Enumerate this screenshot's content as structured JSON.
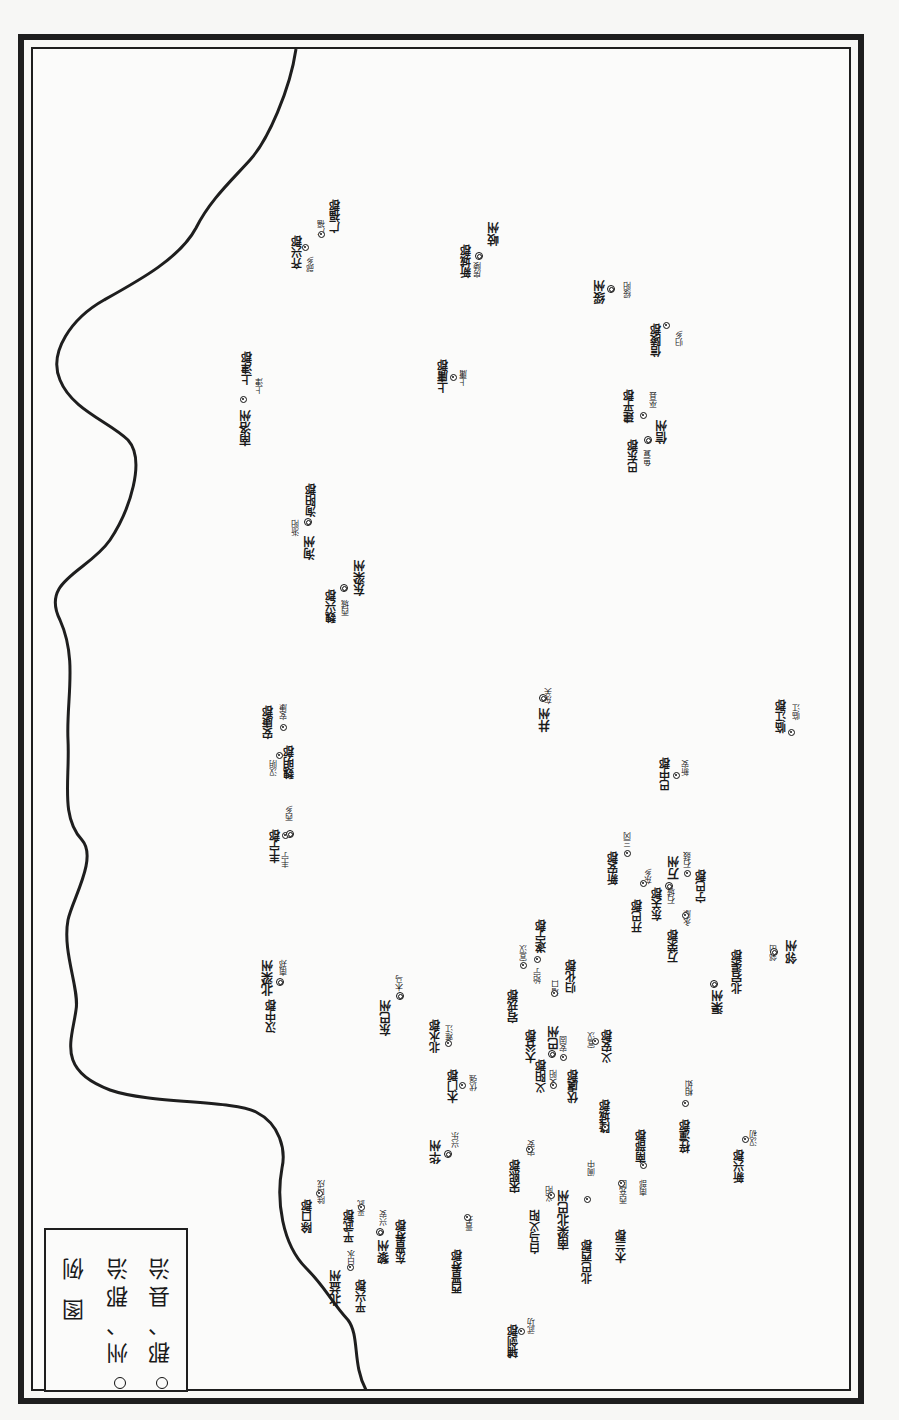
{
  "map": {
    "orientation": "rotated-90-ccw",
    "colors": {
      "ink": "#1e1e1e",
      "paper": "#fbfbfa"
    }
  },
  "legend": {
    "title": "图 例",
    "items": [
      {
        "symbol": "double-circle",
        "label": "州、郡治"
      },
      {
        "symbol": "dot-circle",
        "label": "郡、县治"
      }
    ]
  },
  "places": [
    {
      "id": "p1",
      "name": "齐兴郡",
      "kind": "jun",
      "x": 292,
      "y": 236
    },
    {
      "id": "p2",
      "name": "郧乡",
      "kind": "xian",
      "x": 307,
      "y": 256
    },
    {
      "id": "p3",
      "name": "广福",
      "kind": "xian",
      "x": 318,
      "y": 220
    },
    {
      "id": "p4",
      "name": "广福郡",
      "kind": "jun",
      "x": 330,
      "y": 200
    },
    {
      "id": "p5",
      "name": "新城郡",
      "kind": "jun",
      "x": 461,
      "y": 245
    },
    {
      "id": "p6",
      "name": "房陵",
      "kind": "xian",
      "x": 474,
      "y": 262
    },
    {
      "id": "p7",
      "name": "岐州",
      "kind": "zhou",
      "x": 488,
      "y": 222
    },
    {
      "id": "p8",
      "name": "绥州",
      "kind": "zhou",
      "x": 594,
      "y": 280
    },
    {
      "id": "p9",
      "name": "绥阳",
      "kind": "xian",
      "x": 624,
      "y": 282
    },
    {
      "id": "p10",
      "name": "信陵郡",
      "kind": "jun",
      "x": 651,
      "y": 324
    },
    {
      "id": "p11",
      "name": "归乡",
      "kind": "xian",
      "x": 676,
      "y": 330
    },
    {
      "id": "p12",
      "name": "南洛州",
      "kind": "zhou",
      "x": 240,
      "y": 410
    },
    {
      "id": "p13",
      "name": "上津郡",
      "kind": "jun",
      "x": 242,
      "y": 352
    },
    {
      "id": "p14",
      "name": "上津",
      "kind": "xian",
      "x": 256,
      "y": 378
    },
    {
      "id": "p15",
      "name": "上庸郡",
      "kind": "jun",
      "x": 438,
      "y": 360
    },
    {
      "id": "p16",
      "name": "上庸",
      "kind": "xian",
      "x": 460,
      "y": 370
    },
    {
      "id": "p17",
      "name": "建平郡",
      "kind": "jun",
      "x": 624,
      "y": 390
    },
    {
      "id": "p18",
      "name": "巫县",
      "kind": "xian",
      "x": 650,
      "y": 392
    },
    {
      "id": "p19",
      "name": "巴东郡",
      "kind": "jun",
      "x": 628,
      "y": 440
    },
    {
      "id": "p20",
      "name": "鱼复",
      "kind": "xian",
      "x": 644,
      "y": 450
    },
    {
      "id": "p21",
      "name": "信州",
      "kind": "zhou",
      "x": 656,
      "y": 420
    },
    {
      "id": "p22",
      "name": "淅阳",
      "kind": "xian",
      "x": 292,
      "y": 520
    },
    {
      "id": "p23",
      "name": "洵州",
      "kind": "zhou",
      "x": 304,
      "y": 536
    },
    {
      "id": "p24",
      "name": "洵阳郡",
      "kind": "jun",
      "x": 306,
      "y": 484
    },
    {
      "id": "p25",
      "name": "魏兴郡",
      "kind": "jun",
      "x": 326,
      "y": 590
    },
    {
      "id": "p26",
      "name": "西城",
      "kind": "xian",
      "x": 342,
      "y": 600
    },
    {
      "id": "p27",
      "name": "东梁州",
      "kind": "zhou",
      "x": 354,
      "y": 560
    },
    {
      "id": "p28",
      "name": "安康郡",
      "kind": "jun",
      "x": 263,
      "y": 706
    },
    {
      "id": "p29",
      "name": "安康",
      "kind": "xian",
      "x": 280,
      "y": 704
    },
    {
      "id": "p30",
      "name": "汉阴",
      "kind": "xian",
      "x": 270,
      "y": 760
    },
    {
      "id": "p31",
      "name": "魏明郡",
      "kind": "jun",
      "x": 284,
      "y": 746
    },
    {
      "id": "p32",
      "name": "井州",
      "kind": "zhou",
      "x": 539,
      "y": 708
    },
    {
      "id": "p33",
      "name": "东关",
      "kind": "xian",
      "x": 545,
      "y": 688
    },
    {
      "id": "p34",
      "name": "临江郡",
      "kind": "jun",
      "x": 776,
      "y": 700
    },
    {
      "id": "p35",
      "name": "临江",
      "kind": "xian",
      "x": 793,
      "y": 704
    },
    {
      "id": "p36",
      "name": "巴中郡",
      "kind": "jun",
      "x": 660,
      "y": 758
    },
    {
      "id": "p37",
      "name": "新安",
      "kind": "xian",
      "x": 682,
      "y": 760
    },
    {
      "id": "p38",
      "name": "丰宁郡",
      "kind": "jun",
      "x": 270,
      "y": 830
    },
    {
      "id": "p39",
      "name": "丰宁",
      "kind": "xian",
      "x": 282,
      "y": 852
    },
    {
      "id": "p40",
      "name": "西乡",
      "kind": "xian",
      "x": 286,
      "y": 805
    },
    {
      "id": "p41",
      "name": "新安郡",
      "kind": "jun",
      "x": 608,
      "y": 852
    },
    {
      "id": "p42",
      "name": "三冈",
      "kind": "xian",
      "x": 624,
      "y": 832
    },
    {
      "id": "p43",
      "name": "开巴郡",
      "kind": "jun",
      "x": 632,
      "y": 900
    },
    {
      "id": "p44",
      "name": "东乡",
      "kind": "xian",
      "x": 645,
      "y": 868
    },
    {
      "id": "p45",
      "name": "万州",
      "kind": "zhou",
      "x": 668,
      "y": 856
    },
    {
      "id": "p46",
      "name": "东关郡",
      "kind": "jun",
      "x": 652,
      "y": 888
    },
    {
      "id": "p47",
      "name": "石城",
      "kind": "xian",
      "x": 668,
      "y": 888
    },
    {
      "id": "p48",
      "name": "石鼓",
      "kind": "xian",
      "x": 684,
      "y": 852
    },
    {
      "id": "p49",
      "name": "宁巴郡",
      "kind": "jun",
      "x": 696,
      "y": 870
    },
    {
      "id": "p50",
      "name": "万荣郡",
      "kind": "jun",
      "x": 668,
      "y": 930
    },
    {
      "id": "p51",
      "name": "永康",
      "kind": "xian",
      "x": 684,
      "y": 910
    },
    {
      "id": "p52",
      "name": "北梁州",
      "kind": "zhou",
      "x": 262,
      "y": 960
    },
    {
      "id": "p53",
      "name": "汉中郡",
      "kind": "jun",
      "x": 266,
      "y": 1000
    },
    {
      "id": "p54",
      "name": "南郑",
      "kind": "xian",
      "x": 280,
      "y": 960
    },
    {
      "id": "p55",
      "name": "东巴州",
      "kind": "zhou",
      "x": 380,
      "y": 1000
    },
    {
      "id": "p56",
      "name": "木马",
      "kind": "xian",
      "x": 396,
      "y": 975
    },
    {
      "id": "p57",
      "name": "宣汉",
      "kind": "xian",
      "x": 520,
      "y": 945
    },
    {
      "id": "p58",
      "name": "宕戎郡",
      "kind": "jun",
      "x": 508,
      "y": 990
    },
    {
      "id": "p59",
      "name": "始宁",
      "kind": "xian",
      "x": 534,
      "y": 968
    },
    {
      "id": "p60",
      "name": "遂宁郡",
      "kind": "jun",
      "x": 536,
      "y": 920
    },
    {
      "id": "p61",
      "name": "增口",
      "kind": "xian",
      "x": 552,
      "y": 980
    },
    {
      "id": "p62",
      "name": "归化郡",
      "kind": "jun",
      "x": 566,
      "y": 960
    },
    {
      "id": "p63",
      "name": "渠州",
      "kind": "zhou",
      "x": 712,
      "y": 990
    },
    {
      "id": "p64",
      "name": "北宕渠郡",
      "kind": "jun",
      "x": 732,
      "y": 950
    },
    {
      "id": "p65",
      "name": "邻州",
      "kind": "zhou",
      "x": 786,
      "y": 940
    },
    {
      "id": "p66",
      "name": "邻山",
      "kind": "xian",
      "x": 770,
      "y": 945
    },
    {
      "id": "p67",
      "name": "北水郡",
      "kind": "jun",
      "x": 430,
      "y": 1020
    },
    {
      "id": "p68",
      "name": "难江",
      "kind": "xian",
      "x": 446,
      "y": 1025
    },
    {
      "id": "p69",
      "name": "大谷郡",
      "kind": "jun",
      "x": 526,
      "y": 1030
    },
    {
      "id": "p70",
      "name": "巴州",
      "kind": "zhou",
      "x": 548,
      "y": 1026
    },
    {
      "id": "p71",
      "name": "安固",
      "kind": "xian",
      "x": 560,
      "y": 1036
    },
    {
      "id": "p72",
      "name": "宣汉",
      "kind": "xian",
      "x": 588,
      "y": 1032
    },
    {
      "id": "p73",
      "name": "义安郡",
      "kind": "jun",
      "x": 602,
      "y": 1030
    },
    {
      "id": "p74",
      "name": "木门郡",
      "kind": "jun",
      "x": 448,
      "y": 1070
    },
    {
      "id": "p75",
      "name": "伏强",
      "kind": "xian",
      "x": 470,
      "y": 1075
    },
    {
      "id": "p76",
      "name": "义阳郡",
      "kind": "jun",
      "x": 536,
      "y": 1060
    },
    {
      "id": "p77",
      "name": "义阳",
      "kind": "xian",
      "x": 550,
      "y": 1070
    },
    {
      "id": "p78",
      "name": "伏虞郡",
      "kind": "jun",
      "x": 568,
      "y": 1070
    },
    {
      "id": "p79",
      "name": "隆城郡",
      "kind": "jun",
      "x": 600,
      "y": 1100
    },
    {
      "id": "p80",
      "name": "华州",
      "kind": "zhou",
      "x": 430,
      "y": 1140
    },
    {
      "id": "p81",
      "name": "兴乐",
      "kind": "xian",
      "x": 452,
      "y": 1132
    },
    {
      "id": "p82",
      "name": "宋熙郡",
      "kind": "jun",
      "x": 510,
      "y": 1160
    },
    {
      "id": "p83",
      "name": "宋安",
      "kind": "xian",
      "x": 528,
      "y": 1140
    },
    {
      "id": "p84",
      "name": "白马义阳",
      "kind": "jun",
      "x": 530,
      "y": 1210
    },
    {
      "id": "p85",
      "name": "义阳",
      "kind": "xian",
      "x": 546,
      "y": 1186
    },
    {
      "id": "p86",
      "name": "南梁北巴州",
      "kind": "zhou",
      "x": 558,
      "y": 1190
    },
    {
      "id": "p87",
      "name": "北巴西郡",
      "kind": "jun",
      "x": 582,
      "y": 1240
    },
    {
      "id": "p88",
      "name": "阆中",
      "kind": "xian",
      "x": 588,
      "y": 1160
    },
    {
      "id": "p89",
      "name": "木兰郡",
      "kind": "jun",
      "x": 616,
      "y": 1230
    },
    {
      "id": "p90",
      "name": "西充国",
      "kind": "xian",
      "x": 620,
      "y": 1180
    },
    {
      "id": "p91",
      "name": "南部郡",
      "kind": "jun",
      "x": 636,
      "y": 1130
    },
    {
      "id": "p92",
      "name": "南部",
      "kind": "xian",
      "x": 640,
      "y": 1180
    },
    {
      "id": "p93",
      "name": "梓潼郡",
      "kind": "jun",
      "x": 680,
      "y": 1120
    },
    {
      "id": "p94",
      "name": "相如",
      "kind": "xian",
      "x": 686,
      "y": 1080
    },
    {
      "id": "p95",
      "name": "新兴郡",
      "kind": "jun",
      "x": 734,
      "y": 1150
    },
    {
      "id": "p96",
      "name": "汉初",
      "kind": "xian",
      "x": 750,
      "y": 1130
    },
    {
      "id": "p97",
      "name": "除口郡",
      "kind": "jun",
      "x": 302,
      "y": 1200
    },
    {
      "id": "p98",
      "name": "除口戍",
      "kind": "xian",
      "x": 318,
      "y": 1180
    },
    {
      "id": "p99",
      "name": "平武郡",
      "kind": "jun",
      "x": 344,
      "y": 1210
    },
    {
      "id": "p100",
      "name": "平武",
      "kind": "xian",
      "x": 358,
      "y": 1200
    },
    {
      "id": "p101",
      "name": "北益州",
      "kind": "zhou",
      "x": 330,
      "y": 1270
    },
    {
      "id": "p102",
      "name": "白水",
      "kind": "xian",
      "x": 348,
      "y": 1250
    },
    {
      "id": "p103",
      "name": "平兴郡",
      "kind": "jun",
      "x": 356,
      "y": 1280
    },
    {
      "id": "p104",
      "name": "黎州",
      "kind": "zhou",
      "x": 378,
      "y": 1240
    },
    {
      "id": "p105",
      "name": "兴安",
      "kind": "xian",
      "x": 380,
      "y": 1210
    },
    {
      "id": "p106",
      "name": "东晋寿郡",
      "kind": "jun",
      "x": 396,
      "y": 1220
    },
    {
      "id": "p107",
      "name": "西晋寿郡",
      "kind": "jun",
      "x": 452,
      "y": 1250
    },
    {
      "id": "p108",
      "name": "晋寿",
      "kind": "xian",
      "x": 466,
      "y": 1215
    },
    {
      "id": "p109",
      "name": "辅剑郡",
      "kind": "jun",
      "x": 508,
      "y": 1325
    },
    {
      "id": "p110",
      "name": "武功",
      "kind": "xian",
      "x": 528,
      "y": 1318
    }
  ],
  "markers": [
    {
      "x": 302,
      "y": 244,
      "type": "seat"
    },
    {
      "x": 318,
      "y": 231,
      "type": "seat"
    },
    {
      "x": 475,
      "y": 252,
      "type": "zhou-seat"
    },
    {
      "x": 607,
      "y": 285,
      "type": "zhou-seat"
    },
    {
      "x": 663,
      "y": 322,
      "type": "seat"
    },
    {
      "x": 240,
      "y": 396,
      "type": "seat"
    },
    {
      "x": 450,
      "y": 374,
      "type": "seat"
    },
    {
      "x": 640,
      "y": 412,
      "type": "seat"
    },
    {
      "x": 644,
      "y": 436,
      "type": "zhou-seat"
    },
    {
      "x": 304,
      "y": 518,
      "type": "zhou-seat"
    },
    {
      "x": 340,
      "y": 584,
      "type": "zhou-seat"
    },
    {
      "x": 280,
      "y": 724,
      "type": "seat"
    },
    {
      "x": 276,
      "y": 752,
      "type": "seat"
    },
    {
      "x": 539,
      "y": 694,
      "type": "zhou-seat"
    },
    {
      "x": 788,
      "y": 729,
      "type": "seat"
    },
    {
      "x": 673,
      "y": 772,
      "type": "seat"
    },
    {
      "x": 282,
      "y": 832,
      "type": "seat"
    },
    {
      "x": 286,
      "y": 830,
      "type": "zhou-seat"
    },
    {
      "x": 624,
      "y": 850,
      "type": "seat"
    },
    {
      "x": 640,
      "y": 880,
      "type": "seat"
    },
    {
      "x": 665,
      "y": 882,
      "type": "zhou-seat"
    },
    {
      "x": 684,
      "y": 870,
      "type": "seat"
    },
    {
      "x": 682,
      "y": 912,
      "type": "seat"
    },
    {
      "x": 520,
      "y": 962,
      "type": "seat"
    },
    {
      "x": 534,
      "y": 956,
      "type": "seat"
    },
    {
      "x": 551,
      "y": 990,
      "type": "seat"
    },
    {
      "x": 276,
      "y": 978,
      "type": "zhou-seat"
    },
    {
      "x": 396,
      "y": 992,
      "type": "zhou-seat"
    },
    {
      "x": 710,
      "y": 980,
      "type": "zhou-seat"
    },
    {
      "x": 770,
      "y": 948,
      "type": "zhou-seat"
    },
    {
      "x": 445,
      "y": 1040,
      "type": "seat"
    },
    {
      "x": 548,
      "y": 1050,
      "type": "zhou-seat"
    },
    {
      "x": 560,
      "y": 1054,
      "type": "seat"
    },
    {
      "x": 592,
      "y": 1038,
      "type": "seat"
    },
    {
      "x": 459,
      "y": 1082,
      "type": "seat"
    },
    {
      "x": 550,
      "y": 1082,
      "type": "seat"
    },
    {
      "x": 602,
      "y": 1124,
      "type": "seat"
    },
    {
      "x": 444,
      "y": 1150,
      "type": "zhou-seat"
    },
    {
      "x": 526,
      "y": 1146,
      "type": "seat"
    },
    {
      "x": 548,
      "y": 1192,
      "type": "seat"
    },
    {
      "x": 584,
      "y": 1196,
      "type": "seat"
    },
    {
      "x": 618,
      "y": 1180,
      "type": "seat"
    },
    {
      "x": 640,
      "y": 1162,
      "type": "seat"
    },
    {
      "x": 682,
      "y": 1100,
      "type": "seat"
    },
    {
      "x": 742,
      "y": 1136,
      "type": "seat"
    },
    {
      "x": 316,
      "y": 1190,
      "type": "seat"
    },
    {
      "x": 358,
      "y": 1204,
      "type": "seat"
    },
    {
      "x": 347,
      "y": 1264,
      "type": "seat"
    },
    {
      "x": 376,
      "y": 1228,
      "type": "zhou-seat"
    },
    {
      "x": 464,
      "y": 1214,
      "type": "seat"
    },
    {
      "x": 518,
      "y": 1328,
      "type": "seat"
    }
  ]
}
